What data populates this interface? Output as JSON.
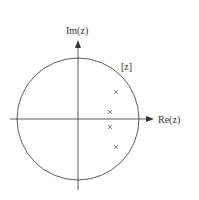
{
  "diagram": {
    "type": "pole-zero plot (z-plane)",
    "plane_label": "[z]",
    "axes": {
      "x_label": "Re(z)",
      "y_label": "Im(z)"
    },
    "unit_circle": {
      "center": [
        78,
        119
      ],
      "radius": 61
    },
    "poles": [
      {
        "x": 116,
        "y": 92
      },
      {
        "x": 110,
        "y": 112
      },
      {
        "x": 110,
        "y": 127
      },
      {
        "x": 116,
        "y": 147
      }
    ],
    "colors": {
      "line": "#333333",
      "pole": "#777777"
    }
  }
}
